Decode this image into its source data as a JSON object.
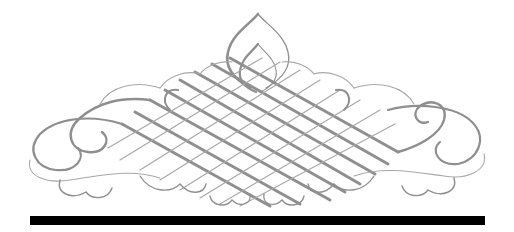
{
  "ornament": {
    "kind": "calligraphic-flourish",
    "description": "Symmetrical gray penwork flourish with diamond lattice center and scroll curls",
    "stroke_color": "#8f8f8f",
    "thin_stroke_color": "#a8a8a8",
    "background": "#ffffff"
  },
  "rule": {
    "color": "#000000"
  }
}
